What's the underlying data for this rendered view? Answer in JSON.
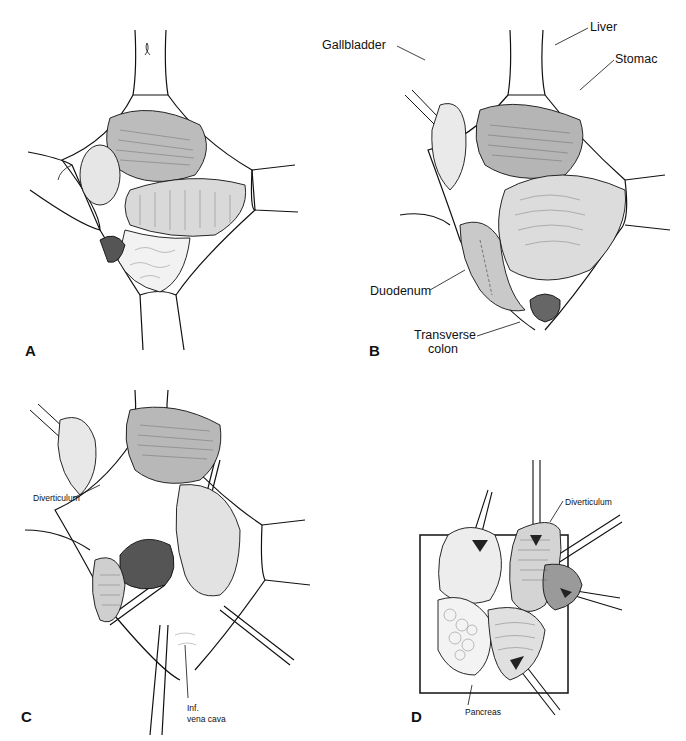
{
  "figure": {
    "panels": [
      {
        "id": "A",
        "letter": "A",
        "labels": []
      },
      {
        "id": "B",
        "letter": "B",
        "labels": [
          {
            "text": "Gallbladder"
          },
          {
            "text": "Liver"
          },
          {
            "text": "Stomac"
          },
          {
            "text": "Duodenum"
          },
          {
            "text": "Transverse"
          },
          {
            "text": "colon"
          }
        ]
      },
      {
        "id": "C",
        "letter": "C",
        "labels": [
          {
            "text": "Diverticulum"
          },
          {
            "text": "Inf."
          },
          {
            "text": "vena cava"
          }
        ]
      },
      {
        "id": "D",
        "letter": "D",
        "labels": [
          {
            "text": "Diverticulum"
          },
          {
            "text": "Pancreas"
          }
        ]
      }
    ],
    "colors": {
      "ink": "#111111",
      "background": "#ffffff",
      "shade": "#555555"
    }
  }
}
